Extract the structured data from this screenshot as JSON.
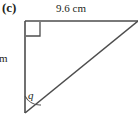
{
  "figure": {
    "part_label": "(c)",
    "shape": "right-triangle",
    "stroke_color": "#4d4d4d",
    "text_color": "#231f20",
    "background_color": "#ffffff"
  },
  "labels": {
    "top_side": "9.6 cm",
    "left_side": "m",
    "angle": "q"
  },
  "markers": {
    "right_angle": "right-angle-square",
    "angle_arc": "angle-arc"
  },
  "geometry": {
    "top_left_vertex": "25,21",
    "top_right_vertex": "138,21",
    "bottom_left_vertex": "25,113",
    "right_angle_square": "26,22 40,22 40,36 26,36",
    "arc_path": "M 25 97 A 16 16 0 0 0 40 104"
  }
}
